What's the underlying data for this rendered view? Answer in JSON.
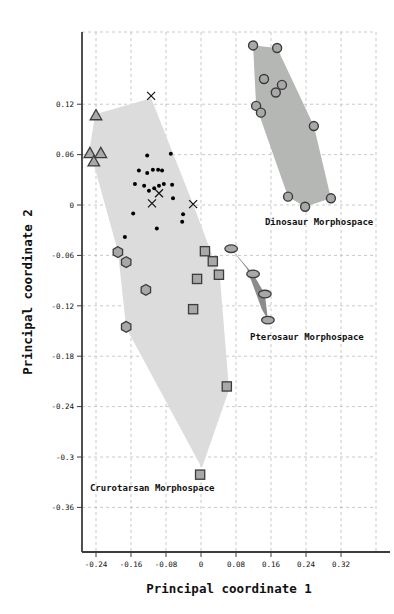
{
  "chart_data": {
    "type": "scatter",
    "title": "",
    "xlabel": "Principal coordinate 1",
    "ylabel": "Principal coordinate 2",
    "xlim": [
      -0.272,
      0.4
    ],
    "ylim": [
      -0.4131,
      0.206
    ],
    "grid": "dashed",
    "legend": "none",
    "x_ticks": {
      "values": [
        -0.24,
        -0.16,
        -0.08,
        0,
        0.08,
        0.16,
        0.24,
        0.32
      ],
      "labels": [
        "-0.24",
        "-0.16",
        "-0.08",
        "0",
        "0.08",
        "0.16",
        "0.24",
        "0.32"
      ]
    },
    "y_ticks": {
      "values": [
        0.12,
        0.06,
        0,
        -0.06,
        -0.12,
        -0.18,
        -0.24,
        -0.3,
        -0.36
      ],
      "labels": [
        "0.12",
        "0.06",
        "0",
        "-0.06",
        "-0.12",
        "-0.18",
        "-0.24",
        "-0.3",
        "-0.36"
      ]
    },
    "series": [
      {
        "name": "dinosaur-circles",
        "marker": "circle",
        "points": [
          [
            0.119,
            0.19
          ],
          [
            0.174,
            0.187
          ],
          [
            0.144,
            0.15
          ],
          [
            0.185,
            0.143
          ],
          [
            0.171,
            0.134
          ],
          [
            0.126,
            0.118
          ],
          [
            0.137,
            0.11
          ],
          [
            0.258,
            0.094
          ],
          [
            0.199,
            0.01
          ],
          [
            0.238,
            -0.002
          ],
          [
            0.297,
            0.008
          ]
        ]
      },
      {
        "name": "crurotarsan-triangles",
        "marker": "triangle-up",
        "points": [
          [
            -0.24,
            0.107
          ],
          [
            -0.254,
            0.062
          ],
          [
            -0.229,
            0.062
          ],
          [
            -0.245,
            0.052
          ]
        ]
      },
      {
        "name": "crurotarsan-dots",
        "marker": "dot",
        "points": [
          [
            -0.123,
            0.059
          ],
          [
            -0.069,
            0.061
          ],
          [
            -0.142,
            0.041
          ],
          [
            -0.123,
            0.038
          ],
          [
            -0.11,
            0.042
          ],
          [
            -0.098,
            0.042
          ],
          [
            -0.089,
            0.041
          ],
          [
            -0.151,
            0.025
          ],
          [
            -0.13,
            0.023
          ],
          [
            -0.119,
            0.017
          ],
          [
            -0.107,
            0.02
          ],
          [
            -0.096,
            0.023
          ],
          [
            -0.085,
            0.025
          ],
          [
            -0.066,
            0.024
          ],
          [
            -0.064,
            0.008
          ],
          [
            -0.155,
            -0.01
          ],
          [
            -0.041,
            -0.011
          ],
          [
            -0.043,
            -0.02
          ],
          [
            -0.101,
            -0.028
          ],
          [
            -0.174,
            -0.038
          ]
        ]
      },
      {
        "name": "crurotarsan-crosses",
        "marker": "x",
        "points": [
          [
            -0.114,
            0.13
          ],
          [
            -0.096,
            0.014
          ],
          [
            -0.112,
            0.002
          ],
          [
            -0.018,
            0.001
          ]
        ]
      },
      {
        "name": "crurotarsan-hexagons",
        "marker": "hexagon",
        "points": [
          [
            -0.19,
            -0.056
          ],
          [
            -0.171,
            -0.068
          ],
          [
            -0.126,
            -0.101
          ],
          [
            -0.171,
            -0.145
          ]
        ]
      },
      {
        "name": "crurotarsan-squares",
        "marker": "square",
        "points": [
          [
            0.009,
            -0.055
          ],
          [
            0.027,
            -0.067
          ],
          [
            -0.009,
            -0.088
          ],
          [
            0.041,
            -0.083
          ],
          [
            -0.018,
            -0.124
          ],
          [
            0.059,
            -0.216
          ],
          [
            -0.002,
            -0.321
          ]
        ]
      },
      {
        "name": "pterosaur-ellipses",
        "marker": "ellipse",
        "points": [
          [
            0.069,
            -0.052
          ],
          [
            0.119,
            -0.082
          ],
          [
            0.146,
            -0.106
          ],
          [
            0.153,
            -0.137
          ]
        ]
      }
    ],
    "morphospace_polygons": [
      {
        "name": "Crurotarsan Morphospace",
        "fill": "#dcdcdc",
        "points": [
          [
            -0.114,
            0.127
          ],
          [
            -0.018,
            0.001
          ],
          [
            0.043,
            -0.084
          ],
          [
            0.064,
            -0.22
          ],
          [
            0.002,
            -0.313
          ],
          [
            -0.171,
            -0.146
          ],
          [
            -0.19,
            -0.055
          ],
          [
            -0.247,
            0.052
          ],
          [
            -0.256,
            0.062
          ],
          [
            -0.242,
            0.108
          ]
        ]
      },
      {
        "name": "Dinosaur Morphospace",
        "fill": "#b4b7b4",
        "points": [
          [
            0.119,
            0.19
          ],
          [
            0.174,
            0.187
          ],
          [
            0.258,
            0.094
          ],
          [
            0.297,
            0.008
          ],
          [
            0.238,
            -0.002
          ],
          [
            0.199,
            0.01
          ],
          [
            0.126,
            0.118
          ]
        ]
      },
      {
        "name": "Pterosaur Morphospace",
        "fill": "#8c8c8c",
        "points": [
          [
            0.069,
            -0.052
          ],
          [
            0.119,
            -0.082
          ],
          [
            0.146,
            -0.106
          ],
          [
            0.153,
            -0.137
          ],
          [
            0.139,
            -0.124
          ],
          [
            0.105,
            -0.076
          ]
        ]
      }
    ],
    "annotations": [
      {
        "text": "Dinosaur Morphospace",
        "x": 0.146,
        "y": -0.024
      },
      {
        "text": "Pterosaur Morphospace",
        "x": 0.112,
        "y": -0.161
      },
      {
        "text": "Crurotarsan Morphospace",
        "x": -0.254,
        "y": -0.34
      }
    ]
  },
  "colors": {
    "background": "#ffffff",
    "marker_fill": "#a8a8a8",
    "marker_edge": "#3c3c3c",
    "dot": "#000000",
    "cross": "#111111",
    "grid": "#bbbbbb",
    "spine": "#3c3c3c",
    "text": "#111111"
  }
}
